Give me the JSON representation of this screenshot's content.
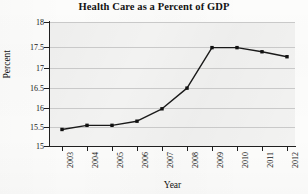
{
  "chart_data": {
    "type": "line",
    "title": "Health Care as a Percent of GDP",
    "xlabel": "Year",
    "ylabel": "Percent",
    "categories": [
      "2003",
      "2004",
      "2005",
      "2006",
      "2007",
      "2008",
      "2009",
      "2010",
      "2011",
      "2012"
    ],
    "x": [
      2003,
      2004,
      2005,
      2006,
      2007,
      2008,
      2009,
      2010,
      2011,
      2012
    ],
    "values": [
      15.4,
      15.5,
      15.5,
      15.6,
      15.9,
      16.4,
      17.38,
      17.38,
      17.28,
      17.16
    ],
    "series": [
      {
        "name": "Health Care as a Percent of GDP",
        "values": [
          15.4,
          15.5,
          15.5,
          15.6,
          15.9,
          16.4,
          17.38,
          17.38,
          17.28,
          17.16
        ]
      }
    ],
    "ylim": [
      15,
      18
    ],
    "xlim": [
      2003,
      2012
    ],
    "yticks": [
      15,
      15.5,
      16,
      16.5,
      17,
      17.5,
      18
    ],
    "ytick_labels": [
      "15",
      "15.5",
      "16",
      "16.5",
      "17",
      "17.5",
      "18"
    ],
    "xtick_labels": [
      "2003",
      "2004",
      "2005",
      "2006",
      "2007",
      "2008",
      "2009",
      "2010",
      "2011",
      "2012"
    ],
    "grid": true,
    "grid_axis": "y",
    "legend": false,
    "legend_position": "none",
    "marker": "square",
    "line_color": "#1a1a1a",
    "marker_color": "#111111",
    "grid_color": "#c9c9c9",
    "plot_background": "#f2f2f1",
    "figure_background": "#fcfcfb",
    "xtick_label_rotation": 90,
    "ylabel_rotation": 90
  }
}
